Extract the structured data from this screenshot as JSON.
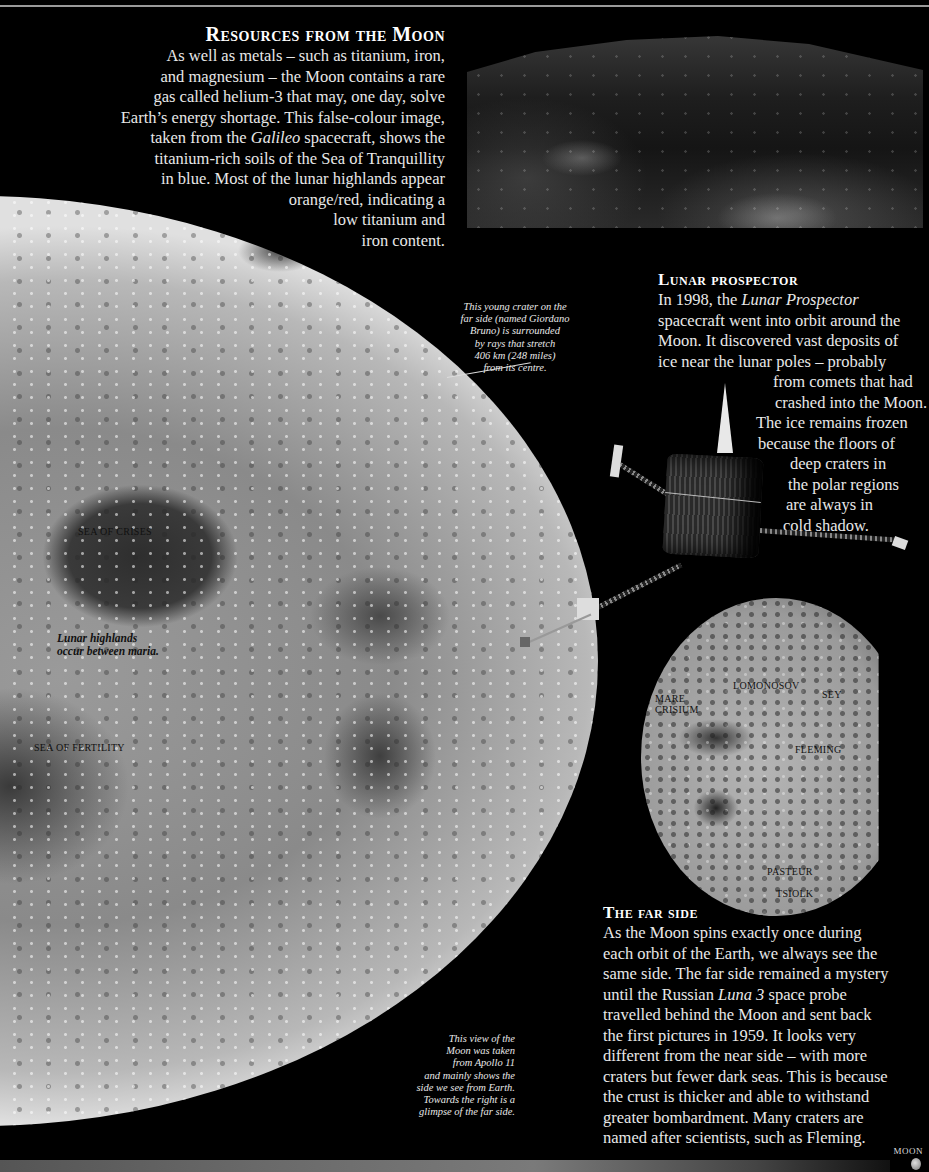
{
  "resources": {
    "heading": "Resources from the Moon",
    "lines": [
      "As well as metals – such as titanium, iron,",
      "and magnesium – the Moon contains a rare",
      "gas called helium-3 that may, one day, solve",
      "Earth’s energy shortage. This false-colour image,",
      "taken from the ",
      "Galileo",
      " spacecraft, shows the",
      "titanium-rich soils of the Sea of Tranquillity",
      "in blue. Most of the lunar highlands appear",
      "orange/red, indicating a",
      "low titanium and",
      "iron content."
    ]
  },
  "big_moon": {
    "labels": {
      "sea_of_crises": "SEA OF CRISES",
      "sea_of_fertility": "SEA OF FERTILITY",
      "highlands_1": "Lunar highlands",
      "highlands_2": "occur between maria."
    },
    "bruno_caption": [
      "This young crater on the",
      "far side (named Giordano",
      "Bruno) is surrounded",
      "by rays that stretch",
      "406 km (248 miles)",
      "from its centre."
    ],
    "apollo_caption": [
      "This view of the",
      "Moon was taken",
      "from Apollo 11",
      "and mainly shows the",
      "side we see from Earth.",
      "Towards the right is a",
      "glimpse of the far side."
    ]
  },
  "prospector": {
    "heading": "Lunar prospector",
    "line1_pre": "In 1998, the ",
    "line1_em": "Lunar Prospector",
    "lines": [
      "spacecraft went into orbit around the",
      "Moon. It discovered vast deposits of",
      "ice near the lunar poles – probably",
      "from comets that had",
      "crashed into the Moon.",
      "The ice remains frozen",
      "because the floors of",
      "deep craters in",
      "the polar regions",
      "are always in",
      "cold shadow."
    ]
  },
  "far_moon": {
    "labels": {
      "mare_1": "MARE",
      "mare_2": "CRISIUM",
      "lomonosov": "LOMONOSOV",
      "seyfert": "SEY",
      "fleming": "FLEMING",
      "pasteur": "PASTEUR",
      "tsiolkovsky": "TSIOLK"
    }
  },
  "farside": {
    "heading": "The far side",
    "lines": [
      "As the Moon spins exactly once during",
      "each orbit of the Earth, we always see the",
      "same side. The far side remained a mystery"
    ],
    "line4_pre": "until the Russian ",
    "line4_em": "Luna 3",
    "line4_post": " space probe",
    "lines_after": [
      "travelled behind the Moon and sent back",
      "the first pictures in 1959. It looks very",
      "different from the near side – with more",
      "craters but fewer dark seas. This is because",
      "the crust is thicker and able to withstand",
      "greater bombardment. Many craters are",
      "named after scientists, such as Fleming."
    ]
  },
  "footer": {
    "folio": "MOON"
  }
}
